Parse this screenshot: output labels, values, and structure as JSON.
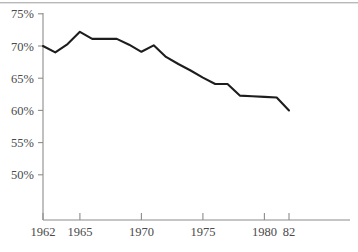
{
  "figure": {
    "name": "line-chart-figure",
    "background_color": "#ffffff",
    "line_color": "#1d1d1d",
    "axis_color": "#8c8c8c",
    "label_color": "#4a4a4a",
    "top_rule_color": "#b9b9b9"
  },
  "chart_data": {
    "type": "line",
    "title": "",
    "subtitle": "",
    "xlabel": "",
    "ylabel": "",
    "grid": false,
    "legend": false,
    "legend_position": "none",
    "xlim": [
      1962,
      1983.5
    ],
    "ylim": [
      47.5,
      76.5
    ],
    "x_tick_values": [
      1962,
      1965,
      1970,
      1975,
      1980,
      1982
    ],
    "x_tick_labels": [
      "1962",
      "1965",
      "1970",
      "1975",
      "1980",
      "82"
    ],
    "y_tick_values": [
      50,
      55,
      60,
      65,
      70,
      75
    ],
    "y_tick_labels": [
      "50%",
      "55%",
      "60%",
      "65%",
      "70%",
      "75%"
    ],
    "series": [
      {
        "name": "percent",
        "x": [
          1962,
          1963,
          1964,
          1965,
          1966,
          1967,
          1968,
          1969,
          1970,
          1971,
          1972,
          1973,
          1974,
          1975,
          1976,
          1977,
          1978,
          1979,
          1980,
          1981,
          1982
        ],
        "values": [
          70.0,
          69.0,
          70.3,
          72.2,
          71.1,
          71.1,
          71.1,
          70.2,
          69.1,
          70.1,
          68.3,
          67.2,
          66.2,
          65.1,
          64.1,
          64.1,
          62.3,
          62.2,
          62.1,
          62.0,
          60.0
        ]
      }
    ],
    "annotations": []
  }
}
